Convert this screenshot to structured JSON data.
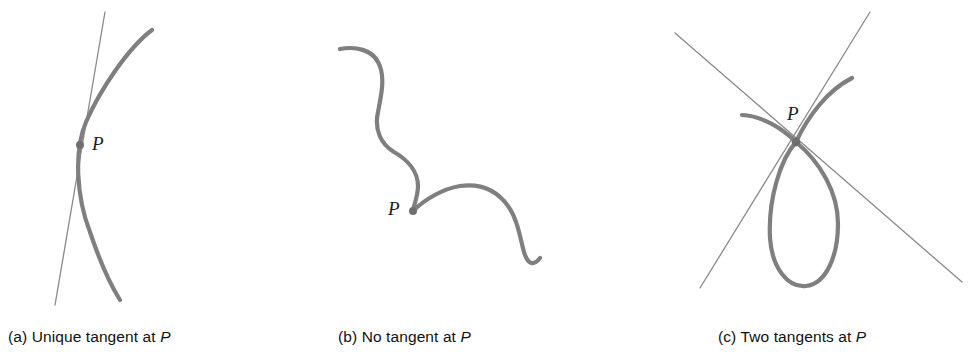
{
  "figure": {
    "background_color": "#ffffff",
    "curve_color": "#7f7f7f",
    "line_color": "#8a8a8a",
    "point_color": "#6e6e6e",
    "text_color": "#111111",
    "curve_width": 4.2,
    "line_width": 1.3,
    "point_radius": 4.0
  },
  "panels": [
    {
      "id": "a",
      "caption_prefix": "(a) Unique tangent at ",
      "caption_point": "P",
      "point_label": "P",
      "point": {
        "x": 80,
        "y": 145
      },
      "curve_path": "M 152 30 C 128 48 100 90 86 122 C 74 150 76 196 90 232 C 100 262 110 284 120 300",
      "tangent_lines": [
        {
          "name": "unique-tangent",
          "x1": 105,
          "y1": 12,
          "x2": 55,
          "y2": 305
        }
      ],
      "tangent_count": 1
    },
    {
      "id": "b",
      "caption_prefix": "(b) No tangent at ",
      "caption_point": "P",
      "point_label": "P",
      "point": {
        "x": 413,
        "y": 211
      },
      "curve_path": "M 340 49 C 356 46 372 50 378 62 C 386 76 381 96 378 112 C 374 130 381 144 394 152 C 408 160 418 172 418 186 C 418 196 414 204 413 211 C 424 200 442 189 460 186 C 482 183 498 192 508 206 C 518 220 520 238 524 252 C 527 262 532 268 540 258",
      "tangent_lines": [],
      "tangent_count": 0
    },
    {
      "id": "c",
      "caption_prefix": "(c) Two tangents at ",
      "caption_point": "P",
      "point_label": "P",
      "point": {
        "x": 796,
        "y": 142
      },
      "curve_branch_left": "M 742 115 C 762 116 782 128 796 142",
      "curve_branch_right": "M 852 78 C 828 90 808 116 796 142",
      "curve_loop": "M 796 142 C 780 160 768 200 770 238 C 772 268 788 288 806 286 C 826 284 838 256 838 224 C 838 192 820 162 796 142",
      "tangent_lines": [
        {
          "name": "tangent-descending",
          "x1": 675,
          "y1": 33,
          "x2": 962,
          "y2": 282
        },
        {
          "name": "tangent-ascending",
          "x1": 870,
          "y1": 12,
          "x2": 700,
          "y2": 288
        }
      ],
      "tangent_count": 2
    }
  ]
}
